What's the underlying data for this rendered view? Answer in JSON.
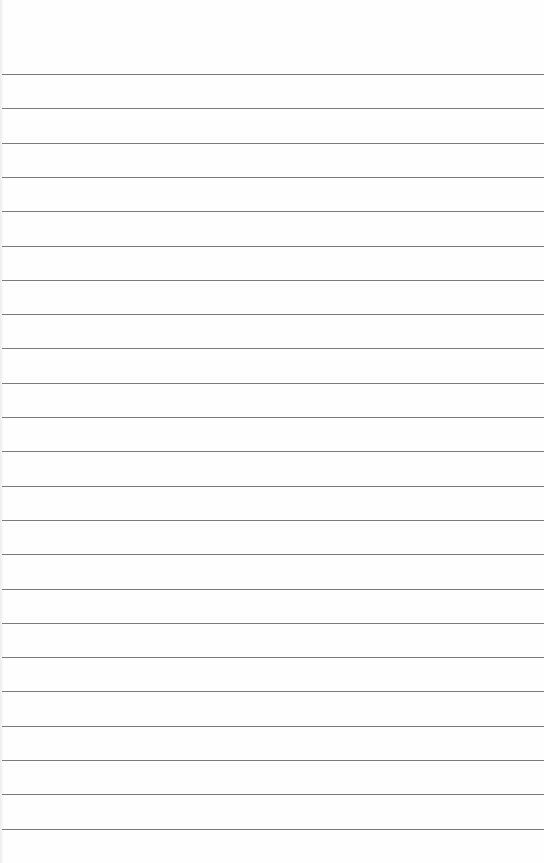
{
  "paper": {
    "type": "lined notebook paper",
    "line_count": 23,
    "first_line_y": 74,
    "line_spacing": 34.3,
    "line_color": "#7a7a7a",
    "background_color": "#fefefe"
  }
}
